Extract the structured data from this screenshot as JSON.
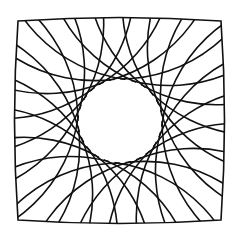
{
  "figure": {
    "canvas": {
      "width": 237,
      "height": 236,
      "background": "#ffffff"
    },
    "stroke_color": "#111111",
    "stroke_width": 1.6,
    "center": {
      "x": 120,
      "y": 121
    },
    "inner_circle_radius": 42,
    "arc_radius": 150,
    "curves_per_family": 24,
    "boundary": {
      "left": 18,
      "top": 21,
      "right": 221,
      "bottom": 220,
      "bulge": 7
    }
  }
}
